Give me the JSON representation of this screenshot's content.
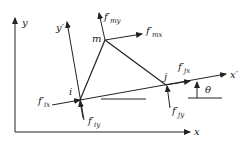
{
  "diagram": {
    "type": "triangular finite element with local and global coordinate systems",
    "global_axes": {
      "x_label": "x",
      "y_label": "y"
    },
    "local_axes": {
      "x_label": "x′",
      "y_label": "y′"
    },
    "nodes": [
      {
        "id": "i",
        "label": "i"
      },
      {
        "id": "m",
        "label": "m"
      },
      {
        "id": "j",
        "label": "j"
      }
    ],
    "forces": [
      {
        "id": "fix",
        "base": "f′",
        "sub": "ix"
      },
      {
        "id": "fiy",
        "base": "f′",
        "sub": "iy"
      },
      {
        "id": "fmx",
        "base": "f′",
        "sub": "mx"
      },
      {
        "id": "fmy",
        "base": "f′",
        "sub": "my"
      },
      {
        "id": "fjx",
        "base": "f′",
        "sub": "jx"
      },
      {
        "id": "fjy",
        "base": "f′",
        "sub": "jy"
      }
    ],
    "angle_label": "θ",
    "colors": {
      "line": "#222222",
      "background": "#ffffff"
    }
  }
}
